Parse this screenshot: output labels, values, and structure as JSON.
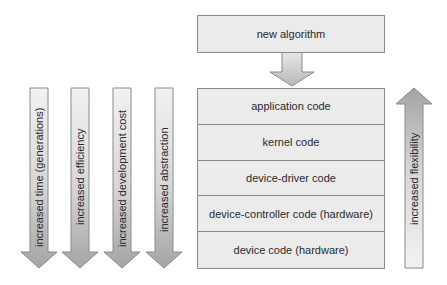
{
  "top_box": {
    "label": "new algorithm"
  },
  "stack": {
    "layers": [
      {
        "label": "application code"
      },
      {
        "label": "kernel code"
      },
      {
        "label": "device-driver code"
      },
      {
        "label": "device-controller code (hardware)"
      },
      {
        "label": "device code (hardware)"
      }
    ]
  },
  "left_arrows": [
    {
      "label": "increased time (generations)",
      "direction": "down"
    },
    {
      "label": "increased efficiency",
      "direction": "down"
    },
    {
      "label": "increased development cost",
      "direction": "down"
    },
    {
      "label": "increased abstraction",
      "direction": "down"
    }
  ],
  "right_arrow": {
    "label": "increased flexibility",
    "direction": "up"
  },
  "colors": {
    "box_fill": "#ebebeb",
    "border": "#8a8a8a",
    "arrow_light": "#efefef",
    "arrow_dark": "#a8a8a8"
  }
}
